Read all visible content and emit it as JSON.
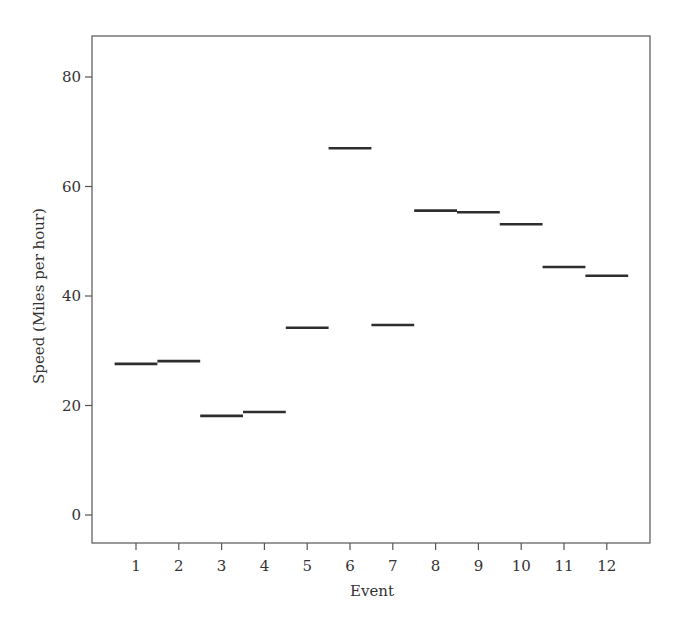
{
  "chart_data": {
    "type": "line",
    "subtype": "step-segments",
    "title": "",
    "xlabel": "Event",
    "ylabel": "Speed (Miles per hour)",
    "categories": [
      "1",
      "2",
      "3",
      "4",
      "5",
      "6",
      "7",
      "8",
      "9",
      "10",
      "11",
      "12"
    ],
    "x": [
      1,
      2,
      3,
      4,
      5,
      6,
      7,
      8,
      9,
      10,
      11,
      12
    ],
    "values": [
      27.6,
      28.1,
      18.1,
      18.8,
      34.2,
      67.0,
      34.7,
      55.6,
      55.3,
      53.1,
      45.3,
      43.7
    ],
    "segment_half_width": 0.5,
    "ylim": [
      -5,
      87
    ],
    "xlim": [
      0,
      13
    ],
    "yticks": [
      0,
      20,
      40,
      60,
      80
    ],
    "xticks": [
      1,
      2,
      3,
      4,
      5,
      6,
      7,
      8,
      9,
      10,
      11,
      12
    ],
    "grid": false,
    "legend": null,
    "colors": {
      "line": "#2e2e2e",
      "frame": "#555555",
      "text": "#333333"
    }
  }
}
